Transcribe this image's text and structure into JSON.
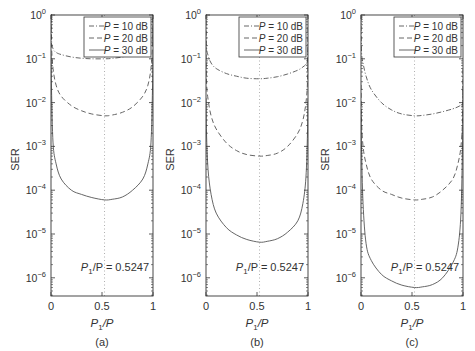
{
  "chart_data": [
    {
      "type": "line",
      "panel_label": "(a)",
      "title": "",
      "xlabel": "P1/P",
      "ylabel": "SER",
      "xlim": [
        0,
        1
      ],
      "ylim": [
        1e-06,
        1
      ],
      "yscale": "log",
      "xticks": [
        "0",
        "0.5",
        "1"
      ],
      "yticks": [
        "10^0",
        "10^-1",
        "10^-2",
        "10^-3",
        "10^-4",
        "10^-5",
        "10^-6"
      ],
      "annotation": "P1/P = 0.5247",
      "vline_x": 0.5247,
      "legend": [
        "P = 10 dB",
        "P = 20 dB",
        "P = 30 dB"
      ],
      "legend_position": "upper right",
      "x": [
        0.005,
        0.02,
        0.05,
        0.1,
        0.2,
        0.3,
        0.4,
        0.5247,
        0.6,
        0.7,
        0.8,
        0.9,
        0.95,
        0.98,
        0.995
      ],
      "series": [
        {
          "name": "P = 10 dB",
          "style": "dash-dot",
          "values": [
            0.28,
            0.17,
            0.14,
            0.125,
            0.11,
            0.103,
            0.1,
            0.1,
            0.102,
            0.11,
            0.125,
            0.15,
            0.18,
            0.22,
            0.3
          ]
        },
        {
          "name": "P = 20 dB",
          "style": "dashed",
          "values": [
            0.2,
            0.06,
            0.025,
            0.014,
            0.0085,
            0.0065,
            0.0055,
            0.005,
            0.0052,
            0.006,
            0.008,
            0.014,
            0.025,
            0.06,
            0.2
          ]
        },
        {
          "name": "P = 30 dB",
          "style": "solid",
          "values": [
            0.02,
            0.0012,
            0.0004,
            0.00018,
            0.0001,
            8e-05,
            6.8e-05,
            6e-05,
            6.2e-05,
            7e-05,
            0.0001,
            0.00018,
            0.0004,
            0.0012,
            0.02
          ]
        }
      ]
    },
    {
      "type": "line",
      "panel_label": "(b)",
      "title": "",
      "xlabel": "P1/P",
      "ylabel": "SER",
      "xlim": [
        0,
        1
      ],
      "ylim": [
        1e-06,
        1
      ],
      "yscale": "log",
      "xticks": [
        "0",
        "0.5",
        "1"
      ],
      "yticks": [
        "10^0",
        "10^-1",
        "10^-2",
        "10^-3",
        "10^-4",
        "10^-5",
        "10^-6"
      ],
      "annotation": "P1/P = 0.5247",
      "vline_x": 0.5247,
      "legend": [
        "P = 10 dB",
        "P = 20 dB",
        "P = 30 dB"
      ],
      "legend_position": "upper right",
      "x": [
        0.005,
        0.02,
        0.05,
        0.1,
        0.2,
        0.3,
        0.4,
        0.5247,
        0.6,
        0.7,
        0.8,
        0.9,
        0.95,
        0.98,
        0.995
      ],
      "series": [
        {
          "name": "P = 10 dB",
          "style": "dash-dot",
          "values": [
            0.2,
            0.12,
            0.08,
            0.06,
            0.046,
            0.04,
            0.036,
            0.035,
            0.036,
            0.039,
            0.045,
            0.055,
            0.065,
            0.075,
            0.085
          ]
        },
        {
          "name": "P = 20 dB",
          "style": "dashed",
          "values": [
            0.03,
            0.012,
            0.005,
            0.0025,
            0.0012,
            0.0008,
            0.00065,
            0.0006,
            0.00062,
            0.0007,
            0.001,
            0.002,
            0.004,
            0.01,
            0.03
          ]
        },
        {
          "name": "P = 30 dB",
          "style": "solid",
          "values": [
            0.002,
            0.0003,
            8e-05,
            3e-05,
            1.4e-05,
            9.5e-06,
            7.5e-06,
            6.5e-06,
            6.8e-06,
            7.8e-06,
            1.1e-05,
            2e-05,
            5e-05,
            0.0002,
            0.002
          ]
        }
      ]
    },
    {
      "type": "line",
      "panel_label": "(c)",
      "title": "",
      "xlabel": "P1/P",
      "ylabel": "SER",
      "xlim": [
        0,
        1
      ],
      "ylim": [
        1e-06,
        1
      ],
      "yscale": "log",
      "xticks": [
        "0",
        "0.5",
        "1"
      ],
      "yticks": [
        "10^0",
        "10^-1",
        "10^-2",
        "10^-3",
        "10^-4",
        "10^-5",
        "10^-6"
      ],
      "annotation": "P1/P = 0.5247",
      "vline_x": 0.5247,
      "legend": [
        "P = 10 dB",
        "P = 20 dB",
        "P = 30 dB"
      ],
      "legend_position": "upper right",
      "x": [
        0.005,
        0.02,
        0.05,
        0.1,
        0.2,
        0.3,
        0.4,
        0.5247,
        0.6,
        0.7,
        0.8,
        0.9,
        0.95,
        0.98,
        0.995
      ],
      "series": [
        {
          "name": "P = 10 dB",
          "style": "dash-dot",
          "values": [
            0.15,
            0.08,
            0.04,
            0.02,
            0.01,
            0.0068,
            0.0055,
            0.005,
            0.0051,
            0.0055,
            0.0062,
            0.0072,
            0.008,
            0.0088,
            0.0095
          ]
        },
        {
          "name": "P = 20 dB",
          "style": "dashed",
          "values": [
            0.004,
            0.001,
            0.0004,
            0.00018,
            0.0001,
            8e-05,
            6.6e-05,
            6e-05,
            6.2e-05,
            7e-05,
            0.0001,
            0.00018,
            0.0004,
            0.001,
            0.004
          ]
        },
        {
          "name": "P = 30 dB",
          "style": "solid",
          "values": [
            0.001,
            5e-05,
            6e-06,
            2.5e-06,
            1.2e-06,
            8.5e-07,
            6.8e-07,
            6e-07,
            6.2e-07,
            7e-07,
            1e-06,
            2.2e-06,
            5e-06,
            3e-05,
            0.001
          ]
        }
      ]
    }
  ],
  "figure": {
    "panels": [
      {
        "label": "(a)",
        "annotation_prefix": "P",
        "annotation_sub": "1",
        "annotation_suffix": "/P = 0.5247"
      },
      {
        "label": "(b)",
        "annotation_prefix": "P",
        "annotation_sub": "1",
        "annotation_suffix": "/P = 0.5247"
      },
      {
        "label": "(c)",
        "annotation_prefix": "P",
        "annotation_sub": "1",
        "annotation_suffix": "/P = 0.5247"
      }
    ],
    "ylabel": "SER",
    "xlabel_main": "P",
    "xlabel_sub": "1",
    "xlabel_suffix": "/P",
    "xticks": [
      "0",
      "0.5",
      "1"
    ],
    "ytick_exponents": [
      "0",
      "−1",
      "−2",
      "−3",
      "−4",
      "−5",
      "−6"
    ],
    "legend": [
      {
        "var": "P",
        "text": " = 10 dB",
        "style": "dash-dot"
      },
      {
        "var": "P",
        "text": " = 20 dB",
        "style": "dashed"
      },
      {
        "var": "P",
        "text": " = 30 dB",
        "style": "solid"
      }
    ],
    "colors": {
      "line": "#555555",
      "axis": "#333333",
      "guide": "#999999"
    }
  }
}
